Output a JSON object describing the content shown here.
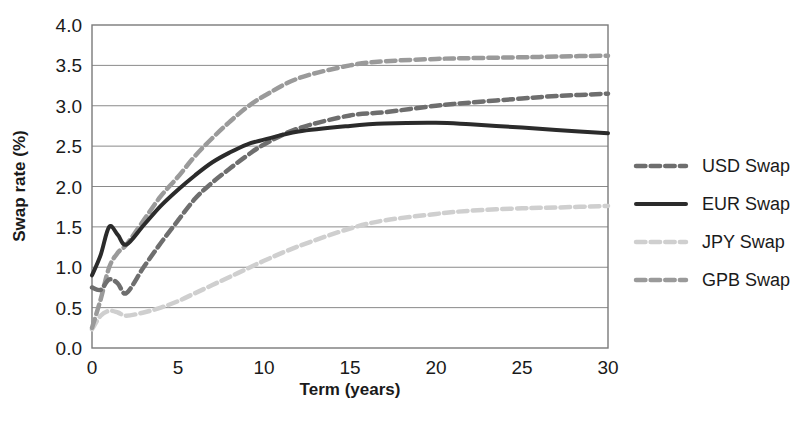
{
  "chart_data": {
    "type": "line",
    "title": "",
    "subtitle": "",
    "xlabel": "Term (years)",
    "ylabel": "Swap rate (%)",
    "xlim": [
      0,
      30
    ],
    "ylim": [
      0,
      4.0
    ],
    "xticks": [
      "0",
      "5",
      "10",
      "15",
      "20",
      "25",
      "30"
    ],
    "xtick_values": [
      0,
      5,
      10,
      15,
      20,
      25,
      30
    ],
    "yticks": [
      "0.0",
      "0.5",
      "1.0",
      "1.5",
      "2.0",
      "2.5",
      "3.0",
      "3.5",
      "4.0"
    ],
    "ytick_values": [
      0.0,
      0.5,
      1.0,
      1.5,
      2.0,
      2.5,
      3.0,
      3.5,
      4.0
    ],
    "grid": true,
    "grid_axis": "y",
    "legend_position": "right",
    "x": [
      0,
      0.5,
      1,
      1.5,
      2,
      3,
      4,
      5,
      6,
      7,
      8,
      9,
      10,
      12,
      15,
      17,
      20,
      22,
      25,
      27,
      30
    ],
    "series": [
      {
        "name": "USD Swap",
        "color": "#6e6e6e",
        "style": "dashed",
        "width": 4.5,
        "values": [
          0.75,
          0.72,
          0.85,
          0.8,
          0.68,
          1.0,
          1.3,
          1.58,
          1.85,
          2.05,
          2.22,
          2.38,
          2.52,
          2.72,
          2.88,
          2.92,
          3.0,
          3.04,
          3.09,
          3.12,
          3.15
        ]
      },
      {
        "name": "EUR Swap",
        "color": "#2b2b2b",
        "style": "solid",
        "width": 4.0,
        "values": [
          0.9,
          1.15,
          1.5,
          1.4,
          1.28,
          1.52,
          1.76,
          1.96,
          2.14,
          2.3,
          2.42,
          2.52,
          2.58,
          2.68,
          2.75,
          2.78,
          2.79,
          2.77,
          2.73,
          2.7,
          2.66
        ]
      },
      {
        "name": "JPY Swap",
        "color": "#cfcfcf",
        "style": "dashed",
        "width": 4.5,
        "values": [
          0.23,
          0.4,
          0.46,
          0.44,
          0.4,
          0.44,
          0.5,
          0.58,
          0.68,
          0.78,
          0.88,
          0.98,
          1.08,
          1.26,
          1.48,
          1.58,
          1.66,
          1.7,
          1.73,
          1.74,
          1.76
        ]
      },
      {
        "name": "GPB Swap",
        "color": "#9a9a9a",
        "style": "dashed",
        "width": 4.5,
        "values": [
          0.25,
          0.6,
          1.0,
          1.18,
          1.28,
          1.58,
          1.88,
          2.12,
          2.38,
          2.6,
          2.8,
          2.98,
          3.12,
          3.34,
          3.5,
          3.55,
          3.58,
          3.59,
          3.6,
          3.61,
          3.62
        ]
      }
    ]
  },
  "legend": {
    "items": [
      {
        "label": "USD Swap"
      },
      {
        "label": "EUR Swap"
      },
      {
        "label": "JPY Swap"
      },
      {
        "label": "GPB Swap"
      }
    ]
  },
  "caption": {
    "text": ""
  }
}
